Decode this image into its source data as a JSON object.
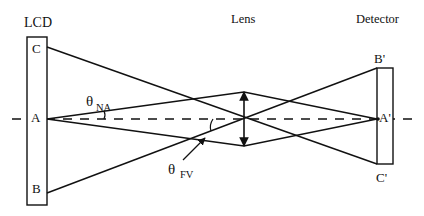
{
  "diagram": {
    "type": "optical-ray-diagram",
    "components": {
      "lcd": {
        "label": "LCD",
        "points": {
          "top": "C",
          "center": "A",
          "bottom": "B"
        }
      },
      "lens": {
        "label": "Lens"
      },
      "detector": {
        "label": "Detector",
        "points": {
          "top": "B'",
          "center": "A'",
          "bottom": "C'"
        }
      }
    },
    "angles": {
      "numerical_aperture": {
        "symbol": "θ",
        "subscript": "NA"
      },
      "field_of_view": {
        "symbol": "θ",
        "subscript": "FV"
      }
    },
    "colors": {
      "stroke": "#111111",
      "background": "#ffffff"
    }
  }
}
